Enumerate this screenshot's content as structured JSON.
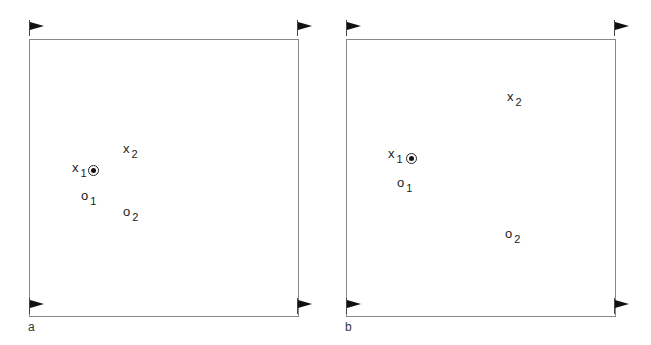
{
  "panels": [
    {
      "id": "a",
      "letter": "a",
      "markers": {
        "x1": {
          "base": "x",
          "sub": "1"
        },
        "x2": {
          "base": "x",
          "sub": "2"
        },
        "o1": {
          "base": "o",
          "sub": "1"
        },
        "o2": {
          "base": "o",
          "sub": "2"
        }
      }
    },
    {
      "id": "b",
      "letter": "b",
      "markers": {
        "x1": {
          "base": "x",
          "sub": "1"
        },
        "x2": {
          "base": "x",
          "sub": "2"
        },
        "o1": {
          "base": "o",
          "sub": "1"
        },
        "o2": {
          "base": "o",
          "sub": "2"
        }
      }
    }
  ],
  "colors": {
    "border": "#888888",
    "flag": "#111111",
    "text": "#222222"
  }
}
